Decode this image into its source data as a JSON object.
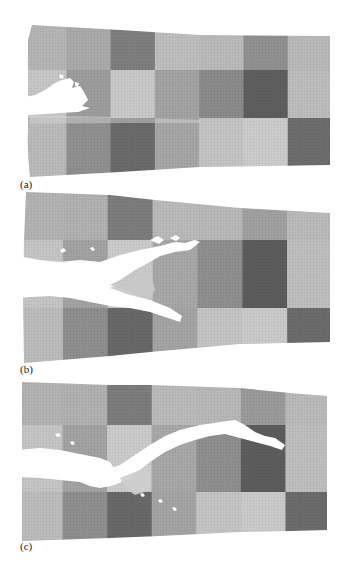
{
  "figure": {
    "panels": [
      {
        "label": "(a)",
        "description": "Simulated specimen with short crack from left edge",
        "grid": {
          "columns": 7,
          "rows": 3,
          "shades": [
            [
              "#b4b4b4",
              "#a9a9a9",
              "#7e7e7e",
              "#bdbdbd",
              "#b9b9b9",
              "#909090",
              "#b8b8b8"
            ],
            [
              "#c6c6c6",
              "#9c9c9c",
              "#c8c8c8",
              "#a2a2a2",
              "#8a8a8a",
              "#5e5e5e",
              "#bcbcbc"
            ],
            [
              "#b9b9b9",
              "#8f8f8f",
              "#6a6a6a",
              "#a5a5a5",
              "#c3c3c3",
              "#cbcbcb",
              "#6c6c6c"
            ]
          ]
        }
      },
      {
        "label": "(b)",
        "description": "Crack branched into two diverging cracks",
        "grid": {
          "columns": 7,
          "rows": 3,
          "shades": [
            [
              "#b2b2b2",
              "#b0b0b0",
              "#7c7c7c",
              "#b9b9b9",
              "#b7b7b7",
              "#a0a0a0",
              "#b9b9b9"
            ],
            [
              "#c4c4c4",
              "#a2a2a2",
              "#cacaca",
              "#a7a7a7",
              "#8e8e8e",
              "#5c5c5c",
              "#bdbdbd"
            ],
            [
              "#bbbbbb",
              "#8e8e8e",
              "#686868",
              "#a3a3a3",
              "#c3c3c3",
              "#c9c9c9",
              "#6b6b6b"
            ]
          ]
        }
      },
      {
        "label": "(c)",
        "description": "Crack propagated in wavy path across specimen",
        "grid": {
          "columns": 7,
          "rows": 3,
          "shades": [
            [
              "#b2b2b2",
              "#b0b0b0",
              "#7c7c7c",
              "#b9b9b9",
              "#b7b7b7",
              "#9a9a9a",
              "#b9b9b9"
            ],
            [
              "#c4c4c4",
              "#a2a2a2",
              "#cacaca",
              "#a7a7a7",
              "#8e8e8e",
              "#5c5c5c",
              "#bdbdbd"
            ],
            [
              "#bbbbbb",
              "#8e8e8e",
              "#686868",
              "#a3a3a3",
              "#c3c3c3",
              "#c9c9c9",
              "#6b6b6b"
            ]
          ]
        }
      }
    ],
    "colors": {
      "background": "#ffffff",
      "crack": "#ffffff",
      "label": "#222222"
    }
  }
}
